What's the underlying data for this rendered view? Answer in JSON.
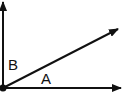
{
  "diagram": {
    "type": "angle-diagram",
    "vertex": {
      "x": 3,
      "y": 88
    },
    "rays": [
      {
        "name": "vertical-ray",
        "from": [
          3,
          88
        ],
        "to": [
          3,
          2
        ]
      },
      {
        "name": "horizontal-ray",
        "from": [
          3,
          88
        ],
        "to": [
          121,
          88
        ]
      },
      {
        "name": "diagonal-ray",
        "from": [
          3,
          88
        ],
        "to": [
          118,
          29
        ]
      }
    ],
    "labels": {
      "angle_a": "A",
      "angle_b": "B"
    },
    "colors": {
      "stroke": "#111111",
      "background": "#ffffff"
    }
  }
}
